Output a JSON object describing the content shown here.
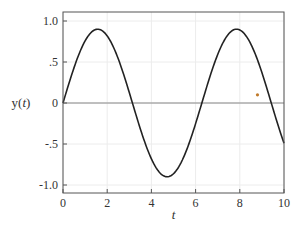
{
  "chart_data": {
    "type": "line",
    "title": "",
    "xlabel": "t",
    "ylabel": "y(t)",
    "xlim": [
      0,
      10
    ],
    "ylim": [
      -1.1,
      1.1
    ],
    "grid": true,
    "xticks": [
      0,
      2,
      4,
      6,
      8,
      10
    ],
    "xtick_labels": [
      "0",
      "2",
      "4",
      "6",
      "8",
      "10"
    ],
    "yticks": [
      1.0,
      0.5,
      0,
      -0.5,
      -1.0
    ],
    "ytick_labels": [
      "1.0",
      ".5",
      "0",
      "-.5",
      "-1.0"
    ],
    "series": [
      {
        "name": "y(t)",
        "color": "#222222",
        "x": [
          0,
          0.5,
          1.0,
          1.57,
          2.0,
          2.5,
          3.0,
          3.14,
          3.5,
          4.0,
          4.71,
          5.0,
          5.5,
          6.0,
          6.28,
          6.5,
          7.0,
          7.85,
          8.5,
          9.0,
          9.42,
          10.0
        ],
        "y": [
          0,
          0.43,
          0.76,
          0.9,
          0.82,
          0.54,
          0.13,
          0,
          -0.31,
          -0.68,
          -0.9,
          -0.86,
          -0.63,
          -0.25,
          0,
          0.19,
          0.59,
          0.9,
          0.72,
          0.37,
          0,
          -0.49
        ]
      }
    ],
    "zero_line": true,
    "annotations": [
      {
        "type": "marker",
        "x": 8.8,
        "y": 0.1,
        "color": "#c07a2a"
      }
    ]
  }
}
